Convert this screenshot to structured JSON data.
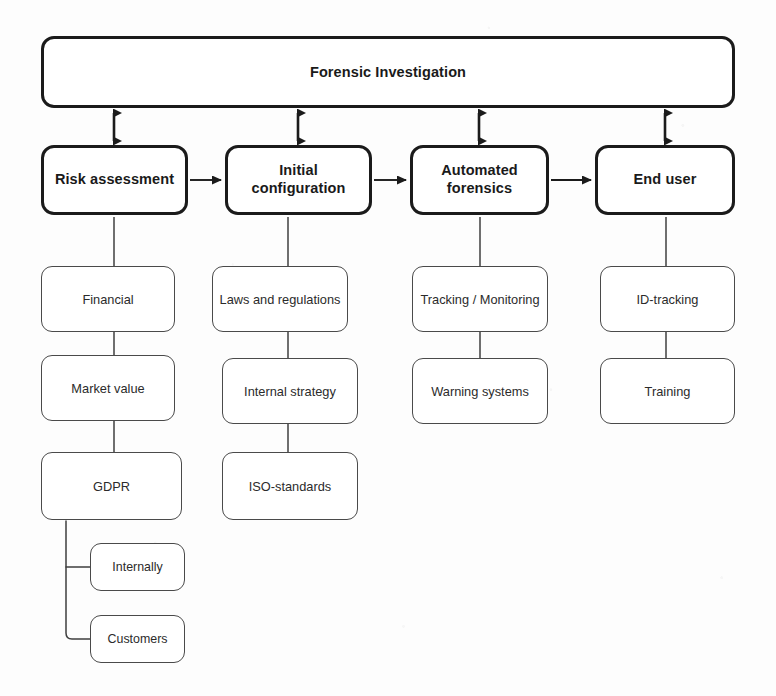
{
  "diagram": {
    "title": "Forensic Investigation",
    "colors": {
      "background": "#fdfdfd",
      "primary_stroke": "#1b1b1b",
      "secondary_stroke": "#4a4a4a",
      "node_fill": "#ffffff",
      "text": "#1a1a1a"
    },
    "root": {
      "label": "Forensic Investigation",
      "x": 41,
      "y": 36,
      "w": 694,
      "h": 72
    },
    "stages": [
      {
        "label": "Risk assessment",
        "x": 41,
        "y": 145,
        "w": 147,
        "h": 70
      },
      {
        "label": "Initial configuration",
        "x": 225,
        "y": 145,
        "w": 147,
        "h": 70
      },
      {
        "label": "Automated\nforensics",
        "x": 410,
        "y": 145,
        "w": 139,
        "h": 70
      },
      {
        "label": "End user",
        "x": 595,
        "y": 145,
        "w": 140,
        "h": 70
      }
    ],
    "branches": [
      {
        "stage": "Risk assessment",
        "items": [
          {
            "label": "Financial",
            "x": 41,
            "y": 266,
            "w": 134,
            "h": 66
          },
          {
            "label": "Market value",
            "x": 41,
            "y": 355,
            "w": 134,
            "h": 66
          },
          {
            "label": "GDPR",
            "x": 41,
            "y": 452,
            "w": 141,
            "h": 68
          }
        ]
      },
      {
        "stage": "Initial configuration",
        "items": [
          {
            "label": "Laws and regulations",
            "x": 212,
            "y": 266,
            "w": 136,
            "h": 66
          },
          {
            "label": "Internal strategy",
            "x": 222,
            "y": 358,
            "w": 136,
            "h": 66
          },
          {
            "label": "ISO-standards",
            "x": 222,
            "y": 452,
            "w": 136,
            "h": 68
          }
        ]
      },
      {
        "stage": "Automated forensics",
        "items": [
          {
            "label": "Tracking / Monitoring",
            "x": 412,
            "y": 266,
            "w": 136,
            "h": 66
          },
          {
            "label": "Warning systems",
            "x": 412,
            "y": 358,
            "w": 136,
            "h": 66
          }
        ]
      },
      {
        "stage": "End user",
        "items": [
          {
            "label": "ID-tracking",
            "x": 600,
            "y": 266,
            "w": 135,
            "h": 66
          },
          {
            "label": "Training",
            "x": 600,
            "y": 358,
            "w": 135,
            "h": 66
          }
        ]
      }
    ],
    "subbranch": {
      "parent": "GDPR",
      "items": [
        {
          "label": "Internally",
          "x": 90,
          "y": 543,
          "w": 95,
          "h": 48
        },
        {
          "label": "Customers",
          "x": 90,
          "y": 615,
          "w": 95,
          "h": 48
        }
      ]
    },
    "connectors": {
      "root_to_stage": "double-headed-vertical-arrow",
      "stage_to_stage": "single-right-arrow",
      "stage_to_leaf": "plain-vertical-line",
      "leaf_to_leaf": "plain-vertical-line",
      "gdpr_to_sub": "elbow-line"
    }
  }
}
